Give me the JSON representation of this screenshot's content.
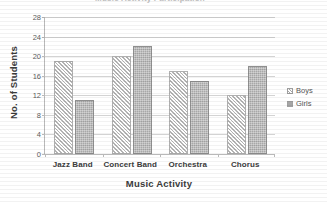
{
  "chart_data": {
    "type": "bar",
    "title": "Music Activity Participation",
    "xlabel": "Music Activity",
    "ylabel": "No. of Students",
    "categories": [
      "Jazz Band",
      "Concert Band",
      "Orchestra",
      "Chorus"
    ],
    "series": [
      {
        "name": "Boys",
        "values": [
          19,
          20,
          17,
          12
        ],
        "pattern": "diagonal-hatch",
        "color": "#b3b3b3"
      },
      {
        "name": "Girls",
        "values": [
          11,
          22,
          15,
          18
        ],
        "pattern": "dotted-fill",
        "color": "#a8a8a8"
      }
    ],
    "ylim": [
      0,
      28
    ],
    "ytick_step": 4,
    "yticks": [
      28,
      24,
      20,
      16,
      12,
      8,
      4,
      0
    ],
    "grid": true,
    "legend_position": "right"
  },
  "legend": {
    "items": [
      {
        "label": "Boys",
        "swatch": "hatch-swatch-icon"
      },
      {
        "label": "Girls",
        "swatch": "solid-swatch-icon"
      }
    ]
  }
}
